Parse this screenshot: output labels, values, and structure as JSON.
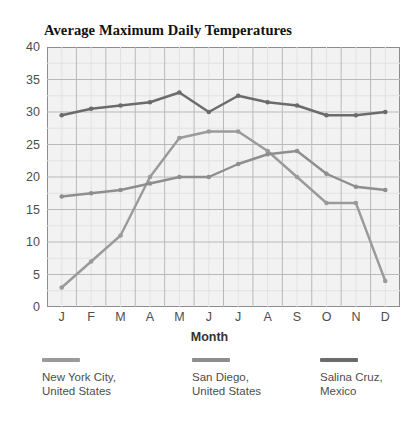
{
  "chart_data": {
    "type": "line",
    "title": "Average Maximum Daily Temperatures",
    "xlabel": "Month",
    "ylabel": "",
    "categories": [
      "J",
      "F",
      "M",
      "A",
      "M",
      "J",
      "J",
      "A",
      "S",
      "O",
      "N",
      "D"
    ],
    "ylim": [
      0,
      40
    ],
    "ytick_step": 5,
    "yticks": [
      0,
      5,
      10,
      15,
      20,
      25,
      30,
      35,
      40
    ],
    "grid": true,
    "minor_grid": true,
    "legend_position": "bottom",
    "series": [
      {
        "name": "New York City, United States",
        "color": "#9a9a9a",
        "values": [
          3,
          7,
          11,
          20,
          26,
          27,
          27,
          24,
          20,
          16,
          16,
          4
        ]
      },
      {
        "name": "San Diego, United States",
        "color": "#8e8e8e",
        "values": [
          17,
          17.5,
          18,
          19,
          20,
          20,
          22,
          23.5,
          24,
          20.5,
          18.5,
          18
        ]
      },
      {
        "name": "Salina Cruz, Mexico",
        "color": "#6b6b6b",
        "values": [
          29.5,
          30.5,
          31,
          31.5,
          33,
          30,
          32.5,
          31.5,
          31,
          29.5,
          29.5,
          30
        ]
      }
    ]
  },
  "legend": [
    {
      "label_line1": "New York City,",
      "label_line2": "United States"
    },
    {
      "label_line1": "San Diego,",
      "label_line2": "United States"
    },
    {
      "label_line1": "Salina Cruz,",
      "label_line2": "Mexico"
    }
  ]
}
